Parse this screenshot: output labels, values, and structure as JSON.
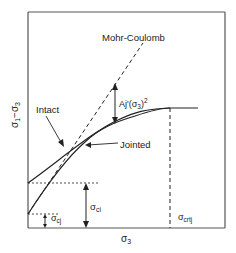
{
  "diagram": {
    "type": "strength-envelope",
    "axes": {
      "x_label": "σ",
      "x_label_sub": "3",
      "y_label": "σ1−σ3",
      "y_label_main": "σ",
      "y_label_sub1": "1",
      "y_label_mid": "−σ",
      "y_label_sub2": "3"
    },
    "curves": [
      {
        "name": "Intact",
        "label": "Intact",
        "style": "solid"
      },
      {
        "name": "Jointed",
        "label": "Jointed",
        "style": "solid"
      },
      {
        "name": "Mohr-Coulomb",
        "label": "Mohr-Coulomb",
        "style": "dashed"
      }
    ],
    "annotations": {
      "aj_label_main": "Aj'(σ",
      "aj_label_sub": "3",
      "aj_label_end": ")",
      "aj_label_sup": "2",
      "sigma_ci_main": "σ",
      "sigma_ci_sub": "ci",
      "sigma_cj_main": "σ",
      "sigma_cj_sub": "cj",
      "sigma_crtj_main": "σ",
      "sigma_crtj_sub": "crtj"
    },
    "colors": {
      "line": "#222222",
      "frame": "#555555"
    }
  }
}
